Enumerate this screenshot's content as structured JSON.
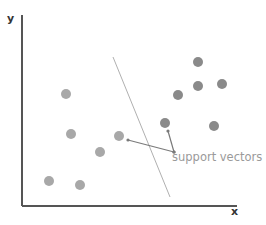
{
  "diagram": {
    "title": "",
    "axes": {
      "x_label": "x",
      "y_label": "y",
      "origin": [
        22,
        206
      ],
      "x_end": [
        237,
        206
      ],
      "y_end": [
        22,
        15
      ],
      "color": "#555555"
    },
    "hyperplane": {
      "from": [
        113,
        57
      ],
      "to": [
        170,
        197
      ],
      "color": "#b0b0b0"
    },
    "class_a": {
      "color": "#a8a8a8",
      "points": [
        [
          66,
          94
        ],
        [
          71,
          134
        ],
        [
          119,
          136
        ],
        [
          100,
          152
        ],
        [
          49,
          181
        ],
        [
          80,
          185
        ]
      ]
    },
    "class_b": {
      "color": "#8a8a8a",
      "points": [
        [
          198,
          62
        ],
        [
          198,
          86
        ],
        [
          222,
          84
        ],
        [
          178,
          95
        ],
        [
          165,
          123
        ],
        [
          214,
          126
        ]
      ]
    },
    "annotation": {
      "label": "support vectors",
      "color": "#9a9a9a",
      "arrows": [
        {
          "from": [
            174,
            152
          ],
          "to": [
            128,
            140
          ]
        },
        {
          "from": [
            174,
            152
          ],
          "to": [
            168,
            131
          ]
        }
      ]
    }
  }
}
